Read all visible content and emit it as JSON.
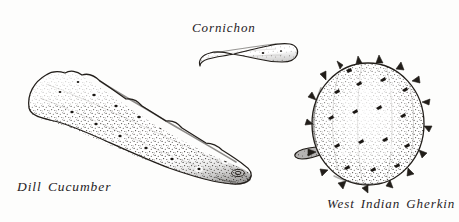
{
  "plate": {
    "title": "Cucumber Varieties",
    "medium": "pen-and-ink stipple illustration",
    "background_color": "#fdfdfc",
    "ink_color": "#26221f",
    "width": 459,
    "height": 222
  },
  "specimens": [
    {
      "id": "dill-cucumber",
      "label": "Dill Cucumber",
      "shape": "long tapered oblong",
      "texture": "dense stipple with scattered dark warts",
      "label_position": "below-left"
    },
    {
      "id": "cornichon",
      "label": "Cornichon",
      "shape": "small slender curved fruit",
      "texture": "light stipple with small spots",
      "label_position": "above-left"
    },
    {
      "id": "west-indian-gherkin",
      "label": "West Indian Gherkin",
      "shape": "round to oval spiny fruit with short stem",
      "texture": "stipple with triangular spines",
      "label_position": "below-center"
    }
  ]
}
